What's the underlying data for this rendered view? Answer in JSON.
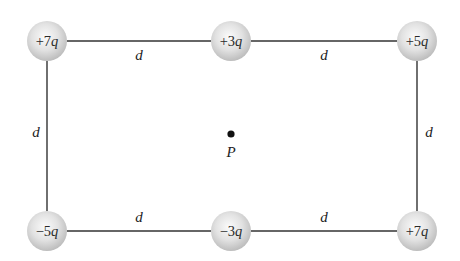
{
  "diagram": {
    "type": "charge-rectangle",
    "line_color": "#333333",
    "sphere_color": "#d6d6d6",
    "charges": [
      {
        "id": "top-left",
        "coef": "+7",
        "unit": "q",
        "cx": 47,
        "cy": 41
      },
      {
        "id": "top-middle",
        "coef": "+3",
        "unit": "q",
        "cx": 231,
        "cy": 41
      },
      {
        "id": "top-right",
        "coef": "+5",
        "unit": "q",
        "cx": 417,
        "cy": 41
      },
      {
        "id": "bottom-left",
        "coef": "−5",
        "unit": "q",
        "cx": 47,
        "cy": 231
      },
      {
        "id": "bottom-middle",
        "coef": "−3",
        "unit": "q",
        "cx": 231,
        "cy": 231
      },
      {
        "id": "bottom-right",
        "coef": "+7",
        "unit": "q",
        "cx": 417,
        "cy": 231
      }
    ],
    "distance_labels": [
      {
        "id": "top-left-segment",
        "text": "d"
      },
      {
        "id": "top-right-segment",
        "text": "d"
      },
      {
        "id": "left-side",
        "text": "d"
      },
      {
        "id": "right-side",
        "text": "d"
      },
      {
        "id": "bottom-left-segment",
        "text": "d"
      },
      {
        "id": "bottom-right-segment",
        "text": "d"
      }
    ],
    "point": {
      "label": "P"
    }
  }
}
